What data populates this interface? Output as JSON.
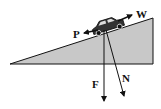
{
  "diagram": {
    "colors": {
      "incline_fill": "#c8c8c8",
      "stroke": "#111111",
      "background": "#ffffff"
    },
    "labels": {
      "P": "P",
      "W": "W",
      "F": "F",
      "N": "N"
    }
  }
}
